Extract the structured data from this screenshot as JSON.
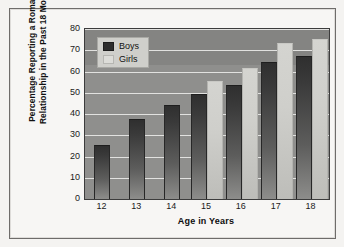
{
  "chart_data": {
    "type": "bar",
    "title": "",
    "xlabel": "Age in Years",
    "ylabel": "Percentage Reporting a Romantic Relationship in the Past 18 Months",
    "ylabel_line1": "Percentage Reporting a Romantic",
    "ylabel_line2": "Relationship in the Past 18 Months",
    "categories": [
      "12",
      "13",
      "14",
      "15",
      "16",
      "17",
      "18"
    ],
    "series": [
      {
        "name": "Boys",
        "color": "#2d2d2d",
        "values": [
          25,
          37,
          44,
          49,
          53,
          64,
          67
        ]
      },
      {
        "name": "Girls",
        "color": "#dcdcd8",
        "values": [
          0,
          0,
          0,
          55,
          61,
          73,
          75
        ]
      }
    ],
    "ylim": [
      0,
      80
    ],
    "ytick_step": 10,
    "yticks": [
      "80",
      "70",
      "60",
      "50",
      "40",
      "30",
      "20",
      "10",
      "0"
    ],
    "grid": true,
    "legend_position": "top-left",
    "plot_background": "#8f8f8d",
    "gridline_color": "#e9e9e7"
  },
  "legend": {
    "items": [
      {
        "label": "Boys"
      },
      {
        "label": "Girls"
      }
    ]
  }
}
